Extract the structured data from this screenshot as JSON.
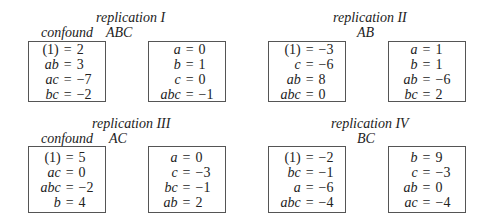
{
  "replications": [
    {
      "title": "replication I",
      "confound_label": "confound",
      "confound": "ABC",
      "blocks": [
        [
          {
            "label": "(1)",
            "value": "2"
          },
          {
            "label": "ab",
            "value": "3"
          },
          {
            "label": "ac",
            "value": "−7"
          },
          {
            "label": "bc",
            "value": "−2"
          }
        ],
        [
          {
            "label": "a",
            "value": "0"
          },
          {
            "label": "b",
            "value": "1"
          },
          {
            "label": "c",
            "value": "0"
          },
          {
            "label": "abc",
            "value": "−1"
          }
        ]
      ]
    },
    {
      "title": "replication II",
      "confound": "AB",
      "blocks": [
        [
          {
            "label": "(1)",
            "value": "−3"
          },
          {
            "label": "c",
            "value": "−6"
          },
          {
            "label": "ab",
            "value": "8"
          },
          {
            "label": "abc",
            "value": "0"
          }
        ],
        [
          {
            "label": "a",
            "value": "1"
          },
          {
            "label": "b",
            "value": "1"
          },
          {
            "label": "ab",
            "value": "−6"
          },
          {
            "label": "bc",
            "value": "2"
          }
        ]
      ]
    },
    {
      "title": "replication III",
      "confound_label": "confound",
      "confound": "AC",
      "blocks": [
        [
          {
            "label": "(1)",
            "value": "5"
          },
          {
            "label": "ac",
            "value": "0"
          },
          {
            "label": "abc",
            "value": "−2"
          },
          {
            "label": "b",
            "value": "4"
          }
        ],
        [
          {
            "label": "a",
            "value": "0"
          },
          {
            "label": "c",
            "value": "−3"
          },
          {
            "label": "bc",
            "value": "−1"
          },
          {
            "label": "ab",
            "value": "2"
          }
        ]
      ]
    },
    {
      "title": "replication IV",
      "confound": "BC",
      "blocks": [
        [
          {
            "label": "(1)",
            "value": "−2"
          },
          {
            "label": "bc",
            "value": "−1"
          },
          {
            "label": "a",
            "value": "−6"
          },
          {
            "label": "abc",
            "value": "−4"
          }
        ],
        [
          {
            "label": "b",
            "value": "9"
          },
          {
            "label": "c",
            "value": "−3"
          },
          {
            "label": "ab",
            "value": "0"
          },
          {
            "label": "ac",
            "value": "−4"
          }
        ]
      ]
    }
  ],
  "equals": "="
}
